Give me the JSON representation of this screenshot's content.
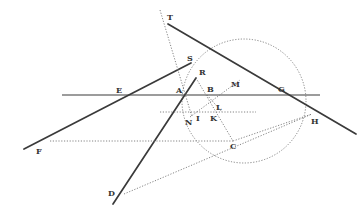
{
  "figure": {
    "title": "",
    "colors": {
      "ink": "#3a3a3a",
      "dotted": "#777777",
      "background": "#ffffff"
    },
    "points": {
      "T": {
        "label": "T",
        "x": 167,
        "y": 20
      },
      "S": {
        "label": "S",
        "x": 190,
        "y": 61
      },
      "R": {
        "label": "R",
        "x": 200,
        "y": 75
      },
      "E": {
        "label": "E",
        "x": 118,
        "y": 92
      },
      "A": {
        "label": "A",
        "x": 177,
        "y": 92
      },
      "B": {
        "label": "B",
        "x": 207,
        "y": 91
      },
      "M": {
        "label": "M",
        "x": 234,
        "y": 86
      },
      "G": {
        "label": "G",
        "x": 280,
        "y": 91
      },
      "L": {
        "label": "L",
        "x": 216,
        "y": 110
      },
      "I": {
        "label": "I",
        "x": 196,
        "y": 120
      },
      "K": {
        "label": "K",
        "x": 211,
        "y": 120
      },
      "N": {
        "label": "N",
        "x": 186,
        "y": 124
      },
      "H": {
        "label": "H",
        "x": 312,
        "y": 123
      },
      "C": {
        "label": "C",
        "x": 230,
        "y": 147
      },
      "F": {
        "label": "F",
        "x": 37,
        "y": 153
      },
      "D": {
        "label": "D",
        "x": 108,
        "y": 195
      }
    }
  }
}
